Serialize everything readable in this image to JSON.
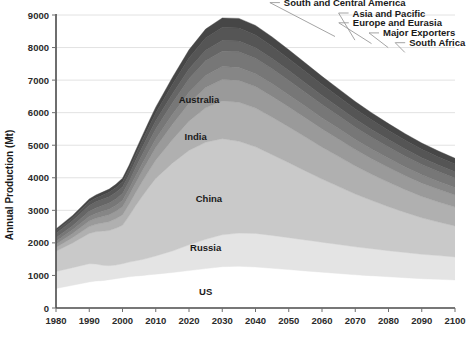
{
  "chart_data": {
    "type": "area",
    "title": "",
    "subtitle": "",
    "xlabel": "",
    "ylabel": "Annual Production (Mt)",
    "xlim": [
      1980,
      2100
    ],
    "ylim": [
      0,
      9000
    ],
    "grid": true,
    "legend_position": "inline-callouts",
    "stacked": true,
    "xtick_labels": [
      "1980",
      "1990",
      "2000",
      "2010",
      "2020",
      "2030",
      "2040",
      "2050",
      "2060",
      "2070",
      "2080",
      "2090",
      "2100"
    ],
    "ytick_labels": [
      "0",
      "1000",
      "2000",
      "3000",
      "4000",
      "5000",
      "6000",
      "7000",
      "8000",
      "9000"
    ],
    "x": [
      1980,
      1985,
      1990,
      1992,
      1994,
      1996,
      1998,
      2000,
      2002,
      2004,
      2006,
      2008,
      2010,
      2015,
      2020,
      2025,
      2030,
      2035,
      2040,
      2045,
      2050,
      2055,
      2060,
      2065,
      2070,
      2075,
      2080,
      2085,
      2090,
      2095,
      2100
    ],
    "series": [
      {
        "name": "US",
        "color": "#ffffff",
        "label_position": {
          "x": 2025,
          "y": 400
        },
        "values": [
          600,
          700,
          800,
          830,
          840,
          870,
          900,
          930,
          960,
          980,
          1000,
          1020,
          1040,
          1090,
          1150,
          1210,
          1270,
          1280,
          1260,
          1220,
          1180,
          1140,
          1100,
          1060,
          1020,
          990,
          960,
          930,
          900,
          880,
          860
        ]
      },
      {
        "name": "Russia",
        "color": "#e4e4e4",
        "label_position": {
          "x": 2025,
          "y": 1750
        },
        "values": [
          520,
          540,
          560,
          520,
          470,
          430,
          420,
          430,
          450,
          470,
          490,
          520,
          560,
          660,
          790,
          900,
          980,
          1020,
          1030,
          1010,
          980,
          950,
          920,
          890,
          860,
          830,
          800,
          775,
          750,
          730,
          710
        ]
      },
      {
        "name": "China",
        "color": "#c9c9c9",
        "label_position": {
          "x": 2026,
          "y": 3250
        },
        "values": [
          620,
          760,
          930,
          990,
          1050,
          1080,
          1130,
          1180,
          1420,
          1700,
          1950,
          2180,
          2380,
          2700,
          2900,
          2980,
          2950,
          2820,
          2660,
          2480,
          2300,
          2120,
          1940,
          1780,
          1620,
          1480,
          1350,
          1230,
          1120,
          1030,
          950
        ]
      },
      {
        "name": "India",
        "color": "#b0b0b0",
        "label_position": {
          "x": 2022,
          "y": 5150
        },
        "values": [
          120,
          160,
          210,
          230,
          250,
          270,
          290,
          320,
          360,
          400,
          450,
          500,
          560,
          720,
          900,
          1060,
          1160,
          1200,
          1190,
          1150,
          1100,
          1040,
          980,
          920,
          860,
          800,
          750,
          700,
          655,
          615,
          580
        ]
      },
      {
        "name": "Australia",
        "color": "#9a9a9a",
        "label_position": {
          "x": 2023,
          "y": 6300
        },
        "values": [
          100,
          130,
          170,
          185,
          200,
          215,
          230,
          250,
          270,
          300,
          330,
          360,
          390,
          470,
          550,
          620,
          660,
          670,
          660,
          640,
          615,
          590,
          560,
          535,
          505,
          480,
          455,
          430,
          410,
          390,
          370
        ]
      },
      {
        "name": "South Africa",
        "color": "#868686",
        "callout": {
          "anchor_x": 2048,
          "anchor_y": 7850,
          "text_x": 2065,
          "text_y": 8150
        },
        "values": [
          90,
          110,
          140,
          150,
          160,
          170,
          180,
          190,
          200,
          215,
          230,
          245,
          260,
          300,
          340,
          375,
          395,
          400,
          395,
          385,
          370,
          355,
          340,
          325,
          310,
          295,
          282,
          268,
          256,
          244,
          232
        ]
      },
      {
        "name": "Major Exporters",
        "color": "#777777",
        "callout": {
          "anchor_x": 2043,
          "anchor_y": 8000,
          "text_x": 2062,
          "text_y": 8450
        },
        "values": [
          110,
          130,
          160,
          170,
          180,
          190,
          200,
          215,
          230,
          250,
          270,
          290,
          310,
          360,
          410,
          450,
          475,
          480,
          475,
          462,
          445,
          428,
          410,
          393,
          376,
          360,
          345,
          330,
          316,
          302,
          290
        ]
      },
      {
        "name": "Europe and Eurasia",
        "color": "#666666",
        "callout": {
          "anchor_x": 2038,
          "anchor_y": 8120,
          "text_x": 2058,
          "text_y": 8760
        },
        "values": [
          130,
          150,
          180,
          185,
          190,
          195,
          200,
          205,
          210,
          220,
          230,
          240,
          250,
          275,
          300,
          320,
          330,
          330,
          325,
          315,
          303,
          290,
          278,
          266,
          254,
          243,
          232,
          222,
          212,
          203,
          195
        ]
      },
      {
        "name": "Asia and Pacific",
        "color": "#555555",
        "callout": {
          "anchor_x": 2033,
          "anchor_y": 8230,
          "text_x": 2053,
          "text_y": 9060
        },
        "values": [
          80,
          95,
          115,
          120,
          125,
          132,
          140,
          150,
          165,
          180,
          200,
          220,
          240,
          290,
          340,
          375,
          395,
          398,
          392,
          380,
          366,
          351,
          336,
          321,
          307,
          293,
          280,
          268,
          256,
          245,
          235
        ]
      },
      {
        "name": "South and Central America",
        "color": "#464646",
        "callout": {
          "anchor_x": 2027,
          "anchor_y": 8340,
          "text_x": 2047,
          "text_y": 9380
        },
        "values": [
          60,
          70,
          85,
          90,
          95,
          100,
          108,
          115,
          125,
          138,
          152,
          166,
          180,
          215,
          250,
          278,
          295,
          298,
          293,
          284,
          273,
          262,
          251,
          240,
          230,
          220,
          210,
          201,
          192,
          184,
          176
        ]
      }
    ]
  },
  "axis": {
    "y_title": "Annual Production (Mt)"
  },
  "labels": {
    "us": "US",
    "russia": "Russia",
    "china": "China",
    "india": "India",
    "australia": "Australia",
    "south_africa": "South Africa",
    "major_exporters": "Major Exporters",
    "europe_eurasia": "Europe and Eurasia",
    "asia_pacific": "Asia and Pacific",
    "south_central_america": "South and Central America"
  }
}
